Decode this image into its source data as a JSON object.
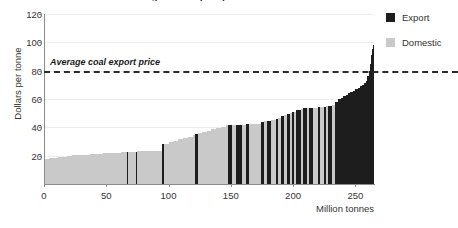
{
  "chart_data": {
    "type": "bar",
    "title": "Average coal export price",
    "subtitle": "",
    "xlabel": "Million tonnes",
    "ylabel": "Dollars per tonne",
    "xlim": [
      0,
      265
    ],
    "ylim": [
      0,
      120
    ],
    "x_ticks": [
      0,
      50,
      100,
      150,
      200,
      250
    ],
    "y_ticks": [
      20,
      40,
      60,
      80,
      100,
      120
    ],
    "grid": true,
    "grid_axis": "y",
    "legend_position": "right",
    "legend": [
      {
        "name": "Export",
        "color": "#1d1d1d"
      },
      {
        "name": "Domestic",
        "color": "#c9c9c9"
      }
    ],
    "annotations": [
      {
        "label": "Average coal export price",
        "type": "hline",
        "value": 80,
        "style": "dashed",
        "color": "#2b2b2b"
      }
    ],
    "series": [
      {
        "name": "Supply blocks",
        "note": "Each entry is one bar: width in million tonnes, cost in dollars per tonne, and market category.",
        "bars": [
          {
            "width": 4,
            "value": 18,
            "category": "Domestic"
          },
          {
            "width": 4,
            "value": 18.3,
            "category": "Domestic"
          },
          {
            "width": 4,
            "value": 18.6,
            "category": "Domestic"
          },
          {
            "width": 3,
            "value": 19,
            "category": "Domestic"
          },
          {
            "width": 4,
            "value": 19.4,
            "category": "Domestic"
          },
          {
            "width": 4,
            "value": 19.8,
            "category": "Domestic"
          },
          {
            "width": 5,
            "value": 20.2,
            "category": "Domestic"
          },
          {
            "width": 5,
            "value": 20.5,
            "category": "Domestic"
          },
          {
            "width": 5,
            "value": 20.8,
            "category": "Domestic"
          },
          {
            "width": 5,
            "value": 21,
            "category": "Domestic"
          },
          {
            "width": 6,
            "value": 21.3,
            "category": "Domestic"
          },
          {
            "width": 5,
            "value": 21.6,
            "category": "Domestic"
          },
          {
            "width": 5,
            "value": 21.9,
            "category": "Domestic"
          },
          {
            "width": 5,
            "value": 22.1,
            "category": "Domestic"
          },
          {
            "width": 5,
            "value": 22.3,
            "category": "Domestic"
          },
          {
            "width": 1.2,
            "value": 22.5,
            "category": "Export"
          },
          {
            "width": 6,
            "value": 22.6,
            "category": "Domestic"
          },
          {
            "width": 1.2,
            "value": 22.8,
            "category": "Export"
          },
          {
            "width": 7,
            "value": 23,
            "category": "Domestic"
          },
          {
            "width": 7,
            "value": 23.2,
            "category": "Domestic"
          },
          {
            "width": 7,
            "value": 23.4,
            "category": "Domestic"
          },
          {
            "width": 1.2,
            "value": 28,
            "category": "Export"
          },
          {
            "width": 4,
            "value": 28.5,
            "category": "Domestic"
          },
          {
            "width": 4,
            "value": 29.5,
            "category": "Domestic"
          },
          {
            "width": 4,
            "value": 30.5,
            "category": "Domestic"
          },
          {
            "width": 4,
            "value": 31.5,
            "category": "Domestic"
          },
          {
            "width": 4,
            "value": 32.5,
            "category": "Domestic"
          },
          {
            "width": 4,
            "value": 33.5,
            "category": "Domestic"
          },
          {
            "width": 2,
            "value": 34.5,
            "category": "Domestic"
          },
          {
            "width": 2.5,
            "value": 35,
            "category": "Export"
          },
          {
            "width": 3,
            "value": 36,
            "category": "Domestic"
          },
          {
            "width": 4,
            "value": 36.5,
            "category": "Domestic"
          },
          {
            "width": 4,
            "value": 37.5,
            "category": "Domestic"
          },
          {
            "width": 4,
            "value": 38.5,
            "category": "Domestic"
          },
          {
            "width": 4,
            "value": 39.5,
            "category": "Domestic"
          },
          {
            "width": 4,
            "value": 40.5,
            "category": "Domestic"
          },
          {
            "width": 1.5,
            "value": 41.5,
            "category": "Domestic"
          },
          {
            "width": 4,
            "value": 42,
            "category": "Export"
          },
          {
            "width": 3,
            "value": 42,
            "category": "Domestic"
          },
          {
            "width": 5,
            "value": 42,
            "category": "Export"
          },
          {
            "width": 3,
            "value": 42,
            "category": "Domestic"
          },
          {
            "width": 3,
            "value": 42.2,
            "category": "Export"
          },
          {
            "width": 6,
            "value": 42.4,
            "category": "Domestic"
          },
          {
            "width": 4,
            "value": 42.6,
            "category": "Domestic"
          },
          {
            "width": 2,
            "value": 44,
            "category": "Export"
          },
          {
            "width": 3,
            "value": 44.2,
            "category": "Domestic"
          },
          {
            "width": 3,
            "value": 44.5,
            "category": "Export"
          },
          {
            "width": 4,
            "value": 45,
            "category": "Domestic"
          },
          {
            "width": 2,
            "value": 46,
            "category": "Export"
          },
          {
            "width": 2,
            "value": 46.5,
            "category": "Domestic"
          },
          {
            "width": 3,
            "value": 48,
            "category": "Export"
          },
          {
            "width": 2,
            "value": 49,
            "category": "Domestic"
          },
          {
            "width": 3,
            "value": 49.5,
            "category": "Export"
          },
          {
            "width": 1.5,
            "value": 50,
            "category": "Domestic"
          },
          {
            "width": 2,
            "value": 50.5,
            "category": "Export"
          },
          {
            "width": 1.5,
            "value": 51,
            "category": "Domestic"
          },
          {
            "width": 4,
            "value": 52,
            "category": "Export"
          },
          {
            "width": 2,
            "value": 53,
            "category": "Domestic"
          },
          {
            "width": 3,
            "value": 53.5,
            "category": "Export"
          },
          {
            "width": 2,
            "value": 53.8,
            "category": "Domestic"
          },
          {
            "width": 3,
            "value": 54,
            "category": "Export"
          },
          {
            "width": 4,
            "value": 54,
            "category": "Domestic"
          },
          {
            "width": 2,
            "value": 54.2,
            "category": "Export"
          },
          {
            "width": 3,
            "value": 54.4,
            "category": "Domestic"
          },
          {
            "width": 2,
            "value": 54.6,
            "category": "Export"
          },
          {
            "width": 1.5,
            "value": 54.8,
            "category": "Domestic"
          },
          {
            "width": 3,
            "value": 55,
            "category": "Export"
          },
          {
            "width": 2.5,
            "value": 55.5,
            "category": "Domestic"
          },
          {
            "width": 3,
            "value": 58,
            "category": "Export"
          },
          {
            "width": 2,
            "value": 60,
            "category": "Export"
          },
          {
            "width": 2,
            "value": 61,
            "category": "Export"
          },
          {
            "width": 2,
            "value": 62,
            "category": "Export"
          },
          {
            "width": 2,
            "value": 63,
            "category": "Export"
          },
          {
            "width": 2,
            "value": 64,
            "category": "Export"
          },
          {
            "width": 2,
            "value": 65,
            "category": "Export"
          },
          {
            "width": 2,
            "value": 66,
            "category": "Export"
          },
          {
            "width": 2,
            "value": 67,
            "category": "Export"
          },
          {
            "width": 2,
            "value": 68,
            "category": "Export"
          },
          {
            "width": 2,
            "value": 69,
            "category": "Export"
          },
          {
            "width": 1.5,
            "value": 70,
            "category": "Export"
          },
          {
            "width": 1.5,
            "value": 71,
            "category": "Export"
          },
          {
            "width": 1.2,
            "value": 73,
            "category": "Export"
          },
          {
            "width": 1.2,
            "value": 76,
            "category": "Export"
          },
          {
            "width": 1,
            "value": 80,
            "category": "Export"
          },
          {
            "width": 1,
            "value": 85,
            "category": "Export"
          },
          {
            "width": 0.8,
            "value": 91,
            "category": "Export"
          },
          {
            "width": 0.8,
            "value": 95,
            "category": "Export"
          },
          {
            "width": 0.6,
            "value": 98,
            "category": "Export"
          }
        ]
      }
    ]
  },
  "axes": {
    "y_label": "Dollars per tonne",
    "x_label": "Million tonnes"
  }
}
